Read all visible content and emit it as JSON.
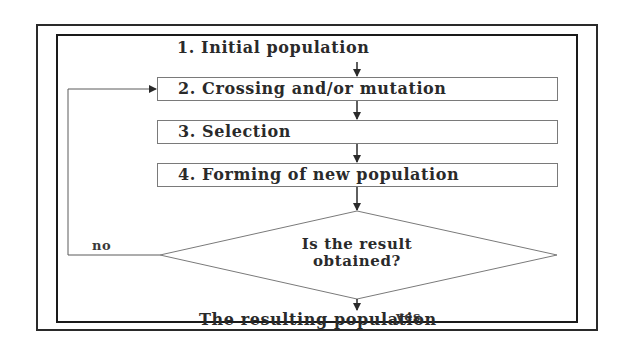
{
  "diagram": {
    "type": "flowchart",
    "steps": [
      {
        "id": "step1",
        "label": "1. Initial population"
      },
      {
        "id": "step2",
        "label": "2. Crossing and/or mutation"
      },
      {
        "id": "step3",
        "label": "3. Selection"
      },
      {
        "id": "step4",
        "label": "4. Forming of new population"
      }
    ],
    "decision": {
      "line1": "Is the result",
      "line2": "obtained?",
      "no_label": "no",
      "yes_label": "yes"
    },
    "result": {
      "label": "The resulting population"
    },
    "edges": [
      {
        "from": "step1",
        "to": "step2"
      },
      {
        "from": "step2",
        "to": "step3"
      },
      {
        "from": "step3",
        "to": "step4"
      },
      {
        "from": "step4",
        "to": "decision"
      },
      {
        "from": "decision",
        "to": "step2",
        "label": "no"
      },
      {
        "from": "decision",
        "to": "result",
        "label": "yes"
      }
    ],
    "colors": {
      "frame": "#1a1a1a",
      "box_border": "#7a7a7a",
      "arrow": "#2a2a2a",
      "text": "#2a2a2a",
      "background": "#ffffff"
    }
  }
}
